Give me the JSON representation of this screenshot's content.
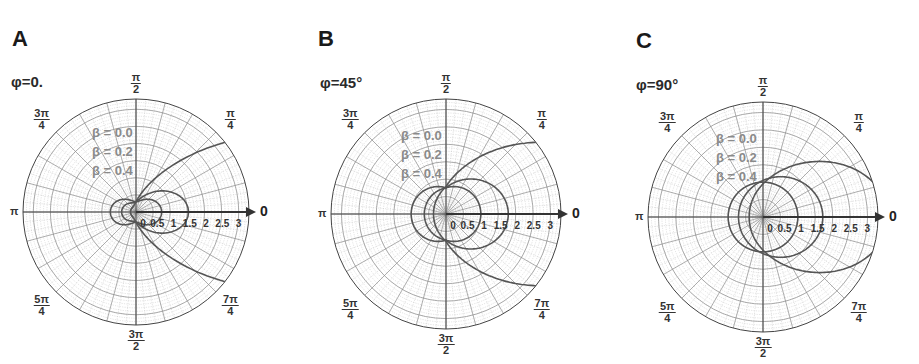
{
  "figure": {
    "panels": [
      {
        "letter": "A",
        "phi_label": "φ=0.",
        "angle_labels": {
          "top": {
            "num": "π",
            "den": "2"
          },
          "top_left": {
            "num": "3π",
            "den": "4"
          },
          "top_right": {
            "num": "π",
            "den": "4"
          },
          "left": "π",
          "right": "0",
          "bottom_left": {
            "num": "5π",
            "den": "4"
          },
          "bottom_right": {
            "num": "7π",
            "den": "4"
          },
          "bottom": {
            "num": "3π",
            "den": "2"
          }
        },
        "legend": [
          "β = 0.0",
          "β = 0.2",
          "β = 0.4"
        ],
        "radial_ticks": [
          "0",
          "0.5",
          "1",
          "1.5",
          "2",
          "2.5",
          "3"
        ]
      },
      {
        "letter": "B",
        "phi_label": "φ=45°",
        "angle_labels": {
          "top": {
            "num": "π",
            "den": "2"
          },
          "top_left": {
            "num": "3π",
            "den": "4"
          },
          "top_right": {
            "num": "π",
            "den": "4"
          },
          "left": "π",
          "right": "0",
          "bottom_left": {
            "num": "5π",
            "den": "4"
          },
          "bottom_right": {
            "num": "7π",
            "den": "4"
          },
          "bottom": {
            "num": "3π",
            "den": "2"
          }
        },
        "legend": [
          "β = 0.0",
          "β = 0.2",
          "β = 0.4"
        ],
        "radial_ticks": [
          "0",
          "0.5",
          "1",
          "1.5",
          "2",
          "2.5",
          "3"
        ]
      },
      {
        "letter": "C",
        "phi_label": "φ=90°",
        "angle_labels": {
          "top": {
            "num": "π",
            "den": "2"
          },
          "top_left": {
            "num": "3π",
            "den": "4"
          },
          "top_right": {
            "num": "π",
            "den": "4"
          },
          "left": "π",
          "right": "0",
          "bottom_left": {
            "num": "5π",
            "den": "4"
          },
          "bottom_right": {
            "num": "7π",
            "den": "4"
          },
          "bottom": {
            "num": "3π",
            "den": "2"
          }
        },
        "legend": [
          "β = 0.0",
          "β = 0.2",
          "β = 0.4"
        ],
        "radial_ticks": [
          "0",
          "0.5",
          "1",
          "1.5",
          "2",
          "2.5",
          "3"
        ]
      }
    ],
    "colors": {
      "curve": "#555555",
      "grid_major": "#8a8a8a",
      "grid_minor": "#c4c4c4",
      "axis": "#444444"
    }
  },
  "chart_data": [
    {
      "type": "polar",
      "title": "φ=0.",
      "panel": "A",
      "r_range": [
        0,
        3.3
      ],
      "r_ticks": [
        0,
        0.5,
        1,
        1.5,
        2,
        2.5,
        3
      ],
      "theta_labels": [
        "0",
        "π/4",
        "π/2",
        "3π/4",
        "π",
        "5π/4",
        "3π/2",
        "7π/4"
      ],
      "grid": true,
      "legend_position": "upper-left inside",
      "series": [
        {
          "name": "β = 0.0",
          "max_r_forward": 0.75,
          "max_r_backward": 0.75,
          "shape": "two-lobe (figure-eight along 0–π axis)"
        },
        {
          "name": "β = 0.2",
          "max_r_forward": 1.25,
          "max_r_backward": 0.6,
          "shape": "forward-skewed two-lobe"
        },
        {
          "name": "β = 0.4",
          "max_r_forward": 3.3,
          "max_r_backward": 0.45,
          "shape": "strongly forward-beamed, extends past outer ring"
        }
      ]
    },
    {
      "type": "polar",
      "title": "φ=45°",
      "panel": "B",
      "r_range": [
        0,
        3.3
      ],
      "r_ticks": [
        0,
        0.5,
        1,
        1.5,
        2,
        2.5,
        3
      ],
      "theta_labels": [
        "0",
        "π/4",
        "π/2",
        "3π/4",
        "π",
        "5π/4",
        "3π/2",
        "7π/4"
      ],
      "grid": true,
      "legend_position": "upper-left inside",
      "series": [
        {
          "name": "β = 0.0",
          "max_r_forward": 1.0,
          "max_r_backward": 1.0,
          "shape": "near-circular"
        },
        {
          "name": "β = 0.2",
          "max_r_forward": 2.0,
          "max_r_backward": 0.95,
          "shape": "egg, forward-skewed"
        },
        {
          "name": "β = 0.4",
          "max_r_forward": 3.3,
          "max_r_backward": 1.2,
          "shape": "strongly forward-beamed, extends past outer ring"
        }
      ]
    },
    {
      "type": "polar",
      "title": "φ=90°",
      "panel": "C",
      "r_range": [
        0,
        3.3
      ],
      "r_ticks": [
        0,
        0.5,
        1,
        1.5,
        2,
        2.5,
        3
      ],
      "theta_labels": [
        "0",
        "π/4",
        "π/2",
        "3π/4",
        "π",
        "5π/4",
        "3π/2",
        "7π/4"
      ],
      "grid": true,
      "legend_position": "upper-left inside",
      "series": [
        {
          "name": "β = 0.0",
          "max_r_forward": 1.0,
          "max_r_backward": 1.0,
          "shape": "circle r=1"
        },
        {
          "name": "β = 0.2",
          "max_r_forward": 2.0,
          "max_r_backward": 0.7,
          "shape": "circle offset forward"
        },
        {
          "name": "β = 0.4",
          "max_r_forward": 3.3,
          "max_r_backward": 0.45,
          "shape": "large circle offset forward, extends past outer ring"
        }
      ]
    }
  ]
}
